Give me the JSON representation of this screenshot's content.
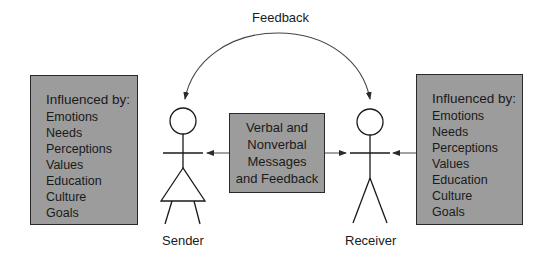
{
  "feedback_label": "Feedback",
  "sender": {
    "label": "Sender",
    "influences": {
      "heading": "Influenced by:",
      "items": [
        "Emotions",
        "Needs",
        "Perceptions",
        "Values",
        "Education",
        "Culture",
        "Goals"
      ]
    }
  },
  "receiver": {
    "label": "Receiver",
    "influences": {
      "heading": "Influenced by:",
      "items": [
        "Emotions",
        "Needs",
        "Perceptions",
        "Values",
        "Education",
        "Culture",
        "Goals"
      ]
    }
  },
  "message_box": {
    "lines": [
      "Verbal and",
      "Nonverbal",
      "Messages",
      "and Feedback"
    ]
  },
  "colors": {
    "box_fill": "#9c9c9c",
    "stroke": "#2a2a2a"
  }
}
